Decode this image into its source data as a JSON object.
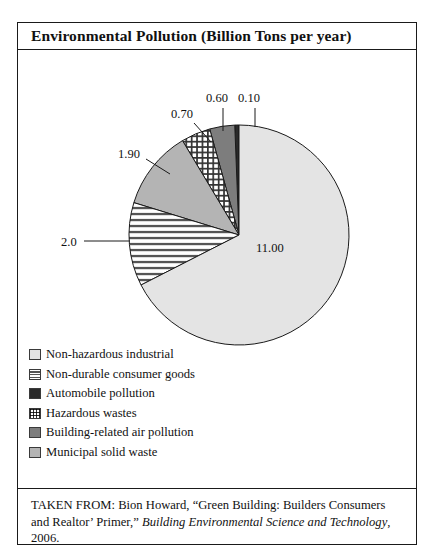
{
  "figure": {
    "title": "Environmental Pollution (Billion Tons per year)",
    "source_prefix": "TAKEN FROM: Bion Howard, “Green Building: Builders Consumers and Realtor’ Primer,” ",
    "source_italic": "Building Environmental Science and Technology",
    "source_suffix": ", 2006."
  },
  "chart_data": {
    "type": "pie",
    "title": "Environmental Pollution (Billion Tons per year)",
    "unit": "Billion Tons per year",
    "categories": [
      "Non-hazardous industrial",
      "Non-durable consumer goods",
      "Municipal solid waste",
      "Hazardous wastes",
      "Building-related air pollution",
      "Automobile pollution"
    ],
    "values": [
      11.0,
      2.0,
      1.9,
      0.7,
      0.6,
      0.1
    ],
    "value_labels": [
      "11.00",
      "2.0",
      "1.90",
      "0.70",
      "0.60",
      "0.10"
    ],
    "total": 16.3,
    "fills": [
      "#e4e4e4",
      "hstripe",
      "#b4b4b4",
      "grid",
      "#7d7d7d",
      "#2a2a2a"
    ],
    "legend_position": "below",
    "grid": false
  },
  "legend": {
    "items": [
      {
        "label": "Non-hazardous industrial",
        "swatch": "light-gray-swatch",
        "fill": "#e4e4e4"
      },
      {
        "label": "Non-durable consumer goods",
        "swatch": "hstripe-swatch",
        "fill": "hstripe"
      },
      {
        "label": "Automobile pollution",
        "swatch": "black-swatch",
        "fill": "#2a2a2a"
      },
      {
        "label": "Hazardous wastes",
        "swatch": "grid-swatch",
        "fill": "grid"
      },
      {
        "label": "Building-related air pollution",
        "swatch": "dark-gray-swatch",
        "fill": "#7d7d7d"
      },
      {
        "label": "Municipal solid waste",
        "swatch": "mid-gray-swatch",
        "fill": "#b4b4b4"
      }
    ]
  },
  "callouts": [
    {
      "name": "callout-0-70",
      "text": "0.70",
      "left": "153px",
      "top": "58px"
    },
    {
      "name": "callout-0-60",
      "text": "0.60",
      "left": "188px",
      "top": "42px"
    },
    {
      "name": "callout-0-10",
      "text": "0.10",
      "left": "220px",
      "top": "42px"
    },
    {
      "name": "callout-1-90",
      "text": "1.90",
      "left": "100px",
      "top": "98px"
    },
    {
      "name": "callout-2-0",
      "text": "2.0",
      "left": "43px",
      "top": "186px"
    },
    {
      "name": "callout-11-00",
      "text": "11.00",
      "left": "238px",
      "top": "192px"
    }
  ]
}
